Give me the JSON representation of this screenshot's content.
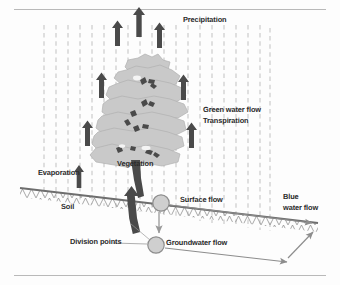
{
  "figure": {
    "title_text": "",
    "type": "water-cycle-diagram",
    "labels": {
      "precipitation": "Precipitation",
      "green_water_flow": "Green water flow",
      "transpiration": "Transpiration",
      "evaporation": "Evaporation",
      "vegetation": "Vegetation",
      "soil": "Soil",
      "surface_flow": "Surface flow",
      "groundwater_flow": "Groundwater flow",
      "division_points": "Division points",
      "blue_water_flow_line1": "Blue",
      "blue_water_flow_line2": "water flow"
    },
    "colors": {
      "canopy_fill": "#c9c9c9",
      "canopy_stroke": "#9a9a9a",
      "arrow_dark": "#4a4a4a",
      "trunk": "#4a4a4a",
      "ground_line": "#6e6e6e",
      "rain_line": "#c4c4c4",
      "circle_fill": "#cfcfcf",
      "circle_stroke": "#8d8d8d",
      "thin_arrow": "#8d8d8d",
      "text": "#2b2b2b",
      "page_rule": "#b9b9b9"
    },
    "elements": {
      "rain_dashed_lines_count": 19,
      "transpiration_arrows_count": 6,
      "evaporation_arrows_count": 1,
      "division_point_circles": 2
    }
  }
}
